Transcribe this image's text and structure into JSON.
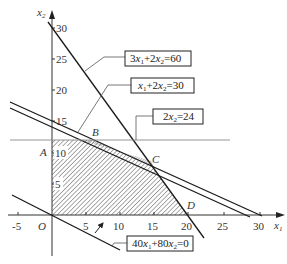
{
  "diagram": {
    "type": "linear-programming-feasible-region",
    "axes": {
      "x_label": "x",
      "x_label_sub": "1",
      "y_label": "x",
      "y_label_sub": "2",
      "origin_label": "O",
      "x_ticks": [
        "-5",
        "5",
        "10",
        "15",
        "20",
        "25",
        "30"
      ],
      "y_ticks": [
        "5",
        "10",
        "15",
        "20",
        "25",
        "30"
      ]
    },
    "points": {
      "A": "A",
      "B": "B",
      "C": "C",
      "D": "D"
    },
    "constraints": [
      {
        "label_parts": [
          "3",
          "x",
          "1",
          "+2",
          "x",
          "2",
          "=60"
        ]
      },
      {
        "label_parts": [
          "",
          "x",
          "1",
          "+2",
          "x",
          "2",
          "=30"
        ]
      },
      {
        "label_parts": [
          "2",
          "x",
          "2",
          "=24"
        ]
      }
    ],
    "objective": {
      "label_parts": [
        "40",
        "x",
        "1",
        "+80",
        "x",
        "2",
        "=0"
      ]
    },
    "feasible_region_vertices": [
      [
        0,
        0
      ],
      [
        0,
        12
      ],
      [
        6,
        12
      ],
      [
        15,
        7.5
      ],
      [
        20,
        0
      ]
    ],
    "colors": {
      "line": "#1a1a1a",
      "axis": "#333333",
      "thin": "#777777",
      "hatch": "#555555"
    }
  }
}
